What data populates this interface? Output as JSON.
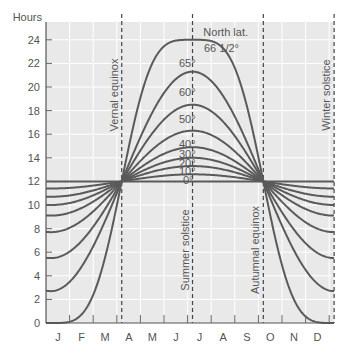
{
  "chart_data": {
    "type": "line",
    "title": "",
    "xlabel": "",
    "ylabel": "Hours",
    "ylim": [
      0,
      24
    ],
    "y_ticks": [
      0,
      2,
      4,
      6,
      8,
      10,
      12,
      14,
      16,
      18,
      20,
      22,
      24
    ],
    "x_ticks": [
      "J",
      "F",
      "M",
      "A",
      "M",
      "J",
      "J",
      "A",
      "S",
      "O",
      "N",
      "D"
    ],
    "grid": true,
    "legend_title": "North lat.",
    "events": [
      {
        "name": "Vernal equinox",
        "month_pos": 2.7
      },
      {
        "name": "Summer solstice",
        "month_pos": 5.7
      },
      {
        "name": "Autumnal equinox",
        "month_pos": 8.7
      },
      {
        "name": "Winter solstice",
        "month_pos": 11.7
      }
    ],
    "series": [
      {
        "name": "0°",
        "latitude": 0,
        "max_hours": 12.0,
        "min_hours": 12.0
      },
      {
        "name": "10°",
        "latitude": 10,
        "max_hours": 12.6,
        "min_hours": 11.4
      },
      {
        "name": "20°",
        "latitude": 20,
        "max_hours": 13.3,
        "min_hours": 10.7
      },
      {
        "name": "30°",
        "latitude": 30,
        "max_hours": 14.0,
        "min_hours": 10.0
      },
      {
        "name": "40°",
        "latitude": 40,
        "max_hours": 14.9,
        "min_hours": 9.1
      },
      {
        "name": "50°",
        "latitude": 50,
        "max_hours": 16.3,
        "min_hours": 7.7
      },
      {
        "name": "60°",
        "latitude": 60,
        "max_hours": 18.5,
        "min_hours": 5.5
      },
      {
        "name": "65°",
        "latitude": 65,
        "max_hours": 21.3,
        "min_hours": 2.7
      },
      {
        "name": "66 1/2°",
        "latitude": 66.5,
        "max_hours": 24.0,
        "min_hours": 0.0
      }
    ]
  },
  "labels": {
    "y_axis_title": "Hours",
    "legend_title": "North lat."
  }
}
